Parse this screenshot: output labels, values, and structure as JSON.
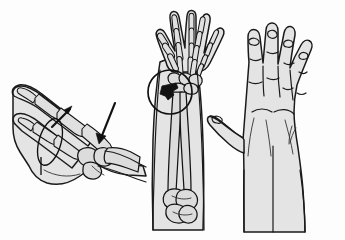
{
  "figure": {
    "background_color": "#fdfdfd",
    "width": 345,
    "height": 240,
    "line_color": "#141414",
    "skin_fill_color": "#e4e4e4",
    "bone_fill_color": "#dcdcdc",
    "fracture_marker_color": "#121212",
    "panel_count": 3
  },
  "panels": [
    {
      "id": "panel-lateral-hand",
      "label": "Lateral view of hand and wrist with skeletal overlay",
      "position": "left",
      "view": "lateral",
      "contents": [
        "extended index finger with phalanges",
        "flexed thumb",
        "metacarpal bones",
        "carpal bones",
        "distal forearm curving downward"
      ],
      "annotations": [
        {
          "name": "upward-arrow",
          "label": "Arrow pointing up and to the right",
          "direction": "up-right",
          "meaning": "dorsal displacement direction"
        },
        {
          "name": "downward-arrow",
          "label": "Arrow pointing down and to the left",
          "direction": "down-left",
          "meaning": "applied force direction at the wrist"
        },
        {
          "name": "motion-loop",
          "label": "Curved loop line indicating range of motion",
          "direction": "circular"
        }
      ]
    },
    {
      "id": "panel-forearm-skeleton",
      "label": "Anterior view of forearm, wrist and hand skeleton",
      "position": "center",
      "view": "anterior",
      "contents": [
        "skeletal hand with five digits",
        "carpal bone row",
        "radius",
        "ulna",
        "distal humerus and elbow joint"
      ],
      "annotations": [
        {
          "name": "wrist-highlight-circle",
          "label": "Circle highlighting the distal radius region",
          "shape": "circle"
        },
        {
          "name": "fracture-wedge-marker",
          "label": "Dark wedge marking the fracture site on the distal radius",
          "color": "#121212"
        }
      ]
    },
    {
      "id": "panel-dorsal-hand",
      "label": "Dorsal view of hand with fingers extended",
      "position": "right",
      "view": "dorsal",
      "contents": [
        "four extended fingers with nail beds",
        "abducted thumb",
        "knuckle crease lines",
        "dorsal tendon lines",
        "wrist and distal forearm"
      ],
      "annotations": []
    }
  ]
}
